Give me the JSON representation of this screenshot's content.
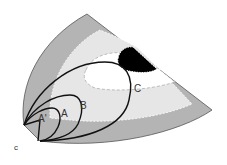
{
  "figure": {
    "panel_label": "c",
    "labels": {
      "a_prime": "A'",
      "a": "A",
      "b": "B",
      "c": "C"
    },
    "colors": {
      "outer_band": "#b4b4b4",
      "middle_band": "#e6e6e6",
      "inner_region": "#ffffff",
      "black_region": "#000000",
      "outline": "#111111"
    }
  }
}
